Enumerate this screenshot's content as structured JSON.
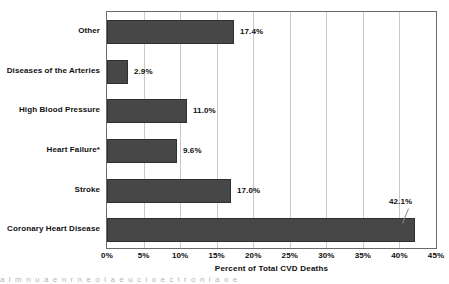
{
  "chart_data": {
    "type": "bar",
    "orientation": "horizontal",
    "title": "",
    "xlabel": "Percent of Total CVD Deaths",
    "ylabel": "",
    "xlim": [
      0,
      45
    ],
    "grid": true,
    "legend": "none",
    "x_tick_labels": [
      "0%",
      "5%",
      "10%",
      "15%",
      "20%",
      "25%",
      "30%",
      "35%",
      "40%",
      "45%"
    ],
    "x_tick_values": [
      0,
      5,
      10,
      15,
      20,
      25,
      30,
      35,
      40,
      45
    ],
    "categories": [
      "Coronary Heart Disease",
      "Stroke",
      "Heart Failure*",
      "High Blood Pressure",
      "Diseases of the Arteries",
      "Other"
    ],
    "values": [
      42.1,
      17.0,
      9.6,
      11.0,
      2.9,
      17.4
    ],
    "data_labels": [
      "42.1%",
      "17.0%",
      "9.6%",
      "11.0%",
      "2.9%",
      "17.4%"
    ],
    "bars_top_to_bottom": [
      {
        "category": "Other",
        "value": 17.4,
        "label": "17.4%",
        "label_raised": false
      },
      {
        "category": "Diseases of the Arteries",
        "value": 2.9,
        "label": "2.9%",
        "label_raised": false
      },
      {
        "category": "High Blood Pressure",
        "value": 11.0,
        "label": "11.0%",
        "label_raised": false
      },
      {
        "category": "Heart Failure*",
        "value": 9.6,
        "label": "9.6%",
        "label_raised": false
      },
      {
        "category": "Stroke",
        "value": 17.0,
        "label": "17.0%",
        "label_raised": false
      },
      {
        "category": "Coronary Heart Disease",
        "value": 42.1,
        "label": "42.1%",
        "label_raised": true
      }
    ],
    "colors": {
      "bar_fill": "#474747",
      "bar_edge": "#2f2f2f",
      "gridline": "#c9c9c9",
      "frame": "#6b6b6b",
      "text": "#101010",
      "background": "#ffffff"
    }
  },
  "scan_artifact": {
    "text": "a   l  m    n   u  a e       n     r  n   e  o  l   a   e  u  c     i  o       e   c  l   r    o  n      i  a o   e"
  }
}
